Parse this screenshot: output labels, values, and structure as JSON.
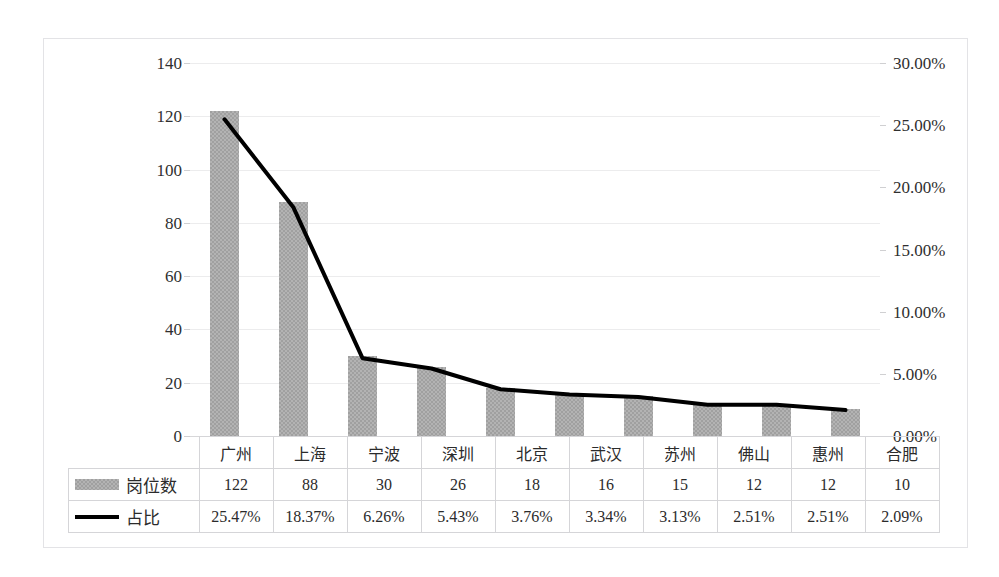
{
  "chart_data": {
    "type": "bar",
    "title": "",
    "subtitle": "",
    "xlabel": "",
    "ylabel": "",
    "categories": [
      "广州",
      "上海",
      "宁波",
      "深圳",
      "北京",
      "武汉",
      "苏州",
      "佛山",
      "惠州",
      "合肥"
    ],
    "series": [
      {
        "name": "岗位数",
        "type": "bar",
        "axis": "left",
        "color": "#a0a0a0",
        "values": [
          122,
          88,
          30,
          26,
          18,
          16,
          15,
          12,
          12,
          10
        ],
        "value_labels": [
          "122",
          "88",
          "30",
          "26",
          "18",
          "16",
          "15",
          "12",
          "12",
          "10"
        ]
      },
      {
        "name": "占比",
        "type": "line",
        "axis": "right",
        "color": "#000000",
        "values": [
          25.47,
          18.37,
          6.26,
          5.43,
          3.76,
          3.34,
          3.13,
          2.51,
          2.51,
          2.09
        ],
        "value_labels": [
          "25.47%",
          "18.37%",
          "6.26%",
          "5.43%",
          "3.76%",
          "3.34%",
          "3.13%",
          "2.51%",
          "2.51%",
          "2.09%"
        ]
      }
    ],
    "left_axis": {
      "ylim": [
        0,
        140
      ],
      "tick_step": 20,
      "ticks": [
        140,
        120,
        100,
        80,
        60,
        40,
        20,
        0
      ],
      "tick_labels": [
        "140",
        "120",
        "100",
        "80",
        "60",
        "40",
        "20",
        "0"
      ]
    },
    "right_axis": {
      "ylim": [
        0,
        30
      ],
      "tick_step": 5,
      "ticks": [
        30,
        25,
        20,
        15,
        10,
        5,
        0
      ],
      "tick_labels": [
        "30.00%",
        "25.00%",
        "20.00%",
        "15.00%",
        "10.00%",
        "5.00%",
        "0.00%"
      ]
    },
    "grid": true,
    "legend_position": "data-table",
    "data_table": {
      "visible": true,
      "row_labels": [
        "岗位数",
        "占比"
      ],
      "rows": [
        [
          "122",
          "88",
          "30",
          "26",
          "18",
          "16",
          "15",
          "12",
          "12",
          "10"
        ],
        [
          "25.47%",
          "18.37%",
          "6.26%",
          "5.43%",
          "3.76%",
          "3.34%",
          "3.13%",
          "2.51%",
          "2.51%",
          "2.09%"
        ]
      ]
    }
  }
}
